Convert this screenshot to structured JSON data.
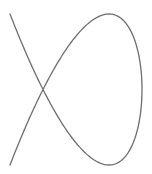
{
  "figure": {
    "type": "lissajous-curve",
    "x_frequency": 2,
    "y_frequency": 3,
    "phase": 0.7854,
    "center": [
      76,
      89.5
    ],
    "amplitude": [
      66,
      75.5
    ],
    "stroke_color": "#6e6e6e",
    "stroke_width": 1.3,
    "background": "#ffffff"
  }
}
